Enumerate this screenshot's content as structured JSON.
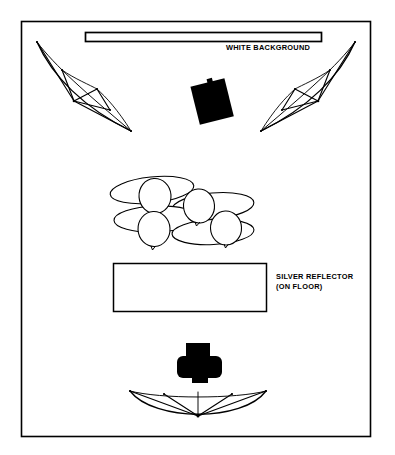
{
  "diagram": {
    "type": "lighting-setup-overhead-plan",
    "colors": {
      "stroke": "#000000",
      "fill_white": "#ffffff",
      "fill_black": "#000000",
      "page_background": "#ffffff"
    },
    "labels": {
      "white_background": "WHITE BACKGROUND",
      "silver_reflector_line1": "SILVER REFLECTOR",
      "silver_reflector_line2": "(ON FLOOR)"
    },
    "elements": {
      "border": {
        "name": "diagram-border",
        "x": 21,
        "y": 21,
        "width": 350,
        "height": 416
      },
      "white_background_bar": {
        "name": "white-background-bar",
        "x": 85,
        "y": 32,
        "width": 237,
        "height": 10
      },
      "silver_reflector_panel": {
        "name": "silver-reflector-panel",
        "x": 113,
        "y": 263,
        "width": 154,
        "height": 49
      },
      "strobe_head": {
        "name": "strobe-head-top-center",
        "cx": 212,
        "cy": 100,
        "rotation_deg": -14
      },
      "camera": {
        "name": "camera-top-view",
        "cx": 199,
        "cy": 362
      },
      "umbrella_left": {
        "name": "umbrella-left"
      },
      "umbrella_right": {
        "name": "umbrella-right"
      },
      "umbrella_bottom": {
        "name": "umbrella-bottom"
      },
      "subject_group": {
        "name": "subject-group",
        "people_count": 4
      }
    }
  }
}
